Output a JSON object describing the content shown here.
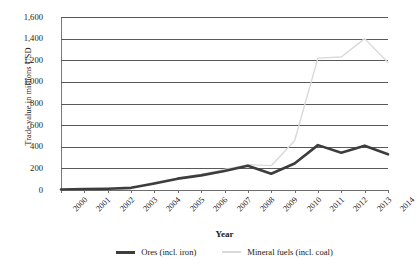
{
  "chart_data": {
    "type": "line",
    "title": "",
    "xlabel": "Year",
    "ylabel": "Trade value in millions USD",
    "categories": [
      "2000",
      "2001",
      "2002",
      "2003",
      "2004",
      "2005",
      "2006",
      "2007",
      "2008",
      "2009",
      "2010",
      "2011",
      "2012",
      "2013",
      "2014"
    ],
    "x": [
      2000,
      2001,
      2002,
      2003,
      2004,
      2005,
      2006,
      2007,
      2008,
      2009,
      2010,
      2011,
      2012,
      2013,
      2014
    ],
    "ylim": [
      0,
      1600
    ],
    "yticks": [
      0,
      200,
      400,
      600,
      800,
      1000,
      1200,
      1400,
      1600
    ],
    "ytick_labels": [
      "0",
      "200",
      "400",
      "600",
      "800",
      "1,000",
      "1,200",
      "1,400",
      "1,600"
    ],
    "grid": "horizontal",
    "legend_position": "bottom",
    "series": [
      {
        "name": "Ores (incl. iron)",
        "color": "#3d3d3d",
        "line_width": 2.6,
        "values": [
          5,
          8,
          12,
          20,
          60,
          105,
          135,
          175,
          225,
          150,
          245,
          415,
          345,
          410,
          330
        ]
      },
      {
        "name": "Mineral fuels (incl. coal)",
        "color": "#d9d9d9",
        "line_width": 1.4,
        "values": [
          3,
          5,
          8,
          15,
          70,
          110,
          145,
          190,
          235,
          225,
          455,
          1220,
          1230,
          1400,
          1180
        ]
      }
    ]
  },
  "axes": {
    "y_title": "Trade value in millions USD",
    "x_title": "Year",
    "y_tick_labels": [
      "1,600",
      "1,400",
      "1,200",
      "1,000",
      "800",
      "600",
      "400",
      "200",
      "0"
    ],
    "x_tick_labels": [
      "2000",
      "2001",
      "2002",
      "2003",
      "2004",
      "2005",
      "2006",
      "2007",
      "2008",
      "2009",
      "2010",
      "2011",
      "2012",
      "2013",
      "2014"
    ]
  },
  "legend": {
    "items": [
      {
        "label": "Ores (incl. iron)",
        "color": "#3d3d3d"
      },
      {
        "label": "Mineral fuels (incl. coal)",
        "color": "#d9d9d9"
      }
    ]
  }
}
